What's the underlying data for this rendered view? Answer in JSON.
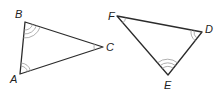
{
  "diagram": {
    "type": "similar-triangles",
    "triangles": [
      {
        "name": "ABC",
        "vertices": [
          {
            "label": "A",
            "x": 20,
            "y": 74,
            "label_x": 10,
            "label_y": 83,
            "angle_marks": 2
          },
          {
            "label": "B",
            "x": 25,
            "y": 22,
            "label_x": 15,
            "label_y": 18,
            "angle_marks": 3
          },
          {
            "label": "C",
            "x": 103,
            "y": 47,
            "label_x": 106,
            "label_y": 51,
            "angle_marks": 1
          }
        ]
      },
      {
        "name": "DEF",
        "vertices": [
          {
            "label": "F",
            "x": 117,
            "y": 16,
            "label_x": 108,
            "label_y": 20,
            "angle_marks": 1
          },
          {
            "label": "D",
            "x": 202,
            "y": 32,
            "label_x": 205,
            "label_y": 33,
            "angle_marks": 2
          },
          {
            "label": "E",
            "x": 168,
            "y": 75,
            "label_x": 164,
            "label_y": 89,
            "angle_marks": 3
          }
        ]
      }
    ],
    "colors": {
      "edge": "#2b2b2b",
      "arc": "#9a9a9a",
      "label": "#222222",
      "background": "#ffffff"
    }
  }
}
